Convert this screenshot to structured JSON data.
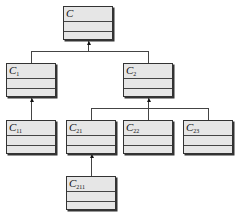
{
  "diagram": {
    "type": "class-hierarchy",
    "classes": [
      {
        "id": "C",
        "base": "C",
        "sub": "",
        "parent": null
      },
      {
        "id": "C1",
        "base": "C",
        "sub": "1",
        "parent": "C"
      },
      {
        "id": "C2",
        "base": "C",
        "sub": "2",
        "parent": "C"
      },
      {
        "id": "C11",
        "base": "C",
        "sub": "11",
        "parent": "C1"
      },
      {
        "id": "C21",
        "base": "C",
        "sub": "21",
        "parent": "C2"
      },
      {
        "id": "C22",
        "base": "C",
        "sub": "22",
        "parent": "C2"
      },
      {
        "id": "C23",
        "base": "C",
        "sub": "23",
        "parent": "C2"
      },
      {
        "id": "C211",
        "base": "C",
        "sub": "211",
        "parent": "C21"
      }
    ],
    "colors": {
      "box_fill": "#e6e6e6",
      "border": "#333333",
      "line": "#444444"
    }
  }
}
